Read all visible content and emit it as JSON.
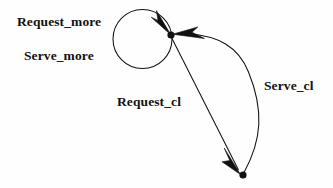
{
  "diagram": {
    "type": "state-transition-diagram",
    "background_color": "#fefefe",
    "stroke_color": "#111111",
    "nodes": [
      {
        "id": "state-top",
        "name": "top-state-node",
        "shape": "filled-dot",
        "x": 171,
        "y": 35,
        "radius": 3.6
      },
      {
        "id": "state-bottom",
        "name": "bottom-state-node",
        "shape": "filled-dot",
        "x": 243,
        "y": 175,
        "radius": 3.6
      }
    ],
    "edges": [
      {
        "id": "edge-self-loop",
        "name": "self-loop-edge",
        "from": "state-top",
        "to": "state-top",
        "style": "circular-self-loop",
        "labels": [
          "Request_more",
          "Serve_more"
        ]
      },
      {
        "id": "edge-request-cl",
        "name": "request-cl-edge",
        "from": "state-top",
        "to": "state-bottom",
        "style": "straight-line",
        "labels": [
          "Request_cl"
        ]
      },
      {
        "id": "edge-serve-cl",
        "name": "serve-cl-edge",
        "from": "state-bottom",
        "to": "state-top",
        "style": "curved-arc",
        "labels": [
          "Serve_cl"
        ]
      }
    ],
    "labels": {
      "request_more": "Request_more",
      "serve_more": "Serve_more",
      "request_cl": "Request_cl",
      "serve_cl": "Serve_cl"
    }
  }
}
